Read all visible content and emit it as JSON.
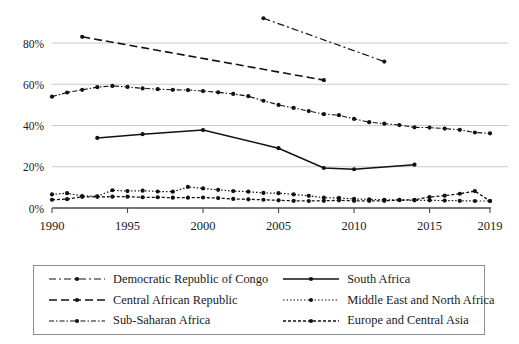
{
  "chart_data": {
    "type": "line",
    "title": "",
    "subtitle": "",
    "xlabel": "",
    "ylabel": "",
    "xlim": [
      1990,
      2019
    ],
    "ylim": [
      0,
      95
    ],
    "grid": true,
    "legend_position": "bottom",
    "x_tick_labels": [
      "1990",
      "1995",
      "2000",
      "2005",
      "2010",
      "2015",
      "2019"
    ],
    "x_ticks": [
      1990,
      1995,
      2000,
      2005,
      2010,
      2015,
      2019
    ],
    "y_tick_labels": [
      "0%",
      "20%",
      "40%",
      "60%",
      "80%"
    ],
    "y_ticks": [
      0,
      20,
      40,
      60,
      80
    ],
    "series": [
      {
        "name": "Democratic Republic of Congo",
        "style": "dash-dot",
        "dasharray": "7,3,2,3",
        "width": 1.2,
        "marker": "circle",
        "x": [
          2004,
          2012
        ],
        "values": [
          92,
          71
        ]
      },
      {
        "name": "Central African Republic",
        "style": "long-dash",
        "dasharray": "8,4",
        "width": 1.6,
        "marker": "circle",
        "x": [
          1992,
          2008
        ],
        "values": [
          83,
          62
        ]
      },
      {
        "name": "Sub-Saharan Africa",
        "style": "dash-dot-dense",
        "dasharray": "5,2,1.5,2",
        "width": 1.1,
        "marker": "circle",
        "x": [
          1990,
          1991,
          1992,
          1993,
          1994,
          1995,
          1996,
          1997,
          1998,
          1999,
          2000,
          2001,
          2002,
          2003,
          2004,
          2005,
          2006,
          2007,
          2008,
          2009,
          2010,
          2011,
          2012,
          2013,
          2014,
          2015,
          2016,
          2017,
          2018,
          2019
        ],
        "values": [
          54.0,
          56.0,
          57.3,
          58.6,
          59.2,
          58.7,
          58.0,
          57.6,
          57.3,
          57.2,
          56.7,
          56.1,
          55.3,
          54.2,
          52.0,
          50.0,
          48.5,
          47.0,
          45.5,
          45.0,
          43.2,
          41.6,
          40.9,
          40.2,
          39.1,
          39.0,
          38.5,
          37.9,
          36.6,
          36.2
        ]
      },
      {
        "name": "South Africa",
        "style": "solid",
        "dasharray": "",
        "width": 1.5,
        "marker": "circle",
        "x": [
          1993,
          1996,
          2000,
          2005,
          2008,
          2010,
          2014
        ],
        "values": [
          34.0,
          35.8,
          37.8,
          29.0,
          19.4,
          18.8,
          21.0
        ]
      },
      {
        "name": "Middle East and North Africa",
        "style": "dotted",
        "dasharray": "1.5,2",
        "width": 1.2,
        "marker": "circle",
        "x": [
          1990,
          1991,
          1992,
          1993,
          1994,
          1995,
          1996,
          1997,
          1998,
          1999,
          2000,
          2001,
          2002,
          2003,
          2004,
          2005,
          2006,
          2007,
          2008,
          2009,
          2010,
          2011,
          2012,
          2013,
          2014,
          2015,
          2016,
          2017,
          2018,
          2019
        ],
        "values": [
          6.6,
          7.2,
          5.8,
          5.7,
          8.6,
          8.2,
          8.4,
          8.0,
          7.9,
          10.2,
          9.5,
          8.8,
          8.2,
          7.9,
          7.3,
          7.2,
          6.6,
          5.9,
          5.0,
          4.9,
          4.4,
          4.2,
          4.0,
          3.9,
          3.7,
          3.7,
          3.6,
          3.5,
          3.4,
          3.4
        ]
      },
      {
        "name": "Europe and Central Asia",
        "style": "dashed",
        "dasharray": "3,2",
        "width": 1.3,
        "marker": "circle",
        "x": [
          1990,
          1991,
          1992,
          1993,
          1994,
          1995,
          1996,
          1997,
          1998,
          1999,
          2000,
          2001,
          2002,
          2003,
          2004,
          2005,
          2006,
          2007,
          2008,
          2009,
          2010,
          2011,
          2012,
          2013,
          2014,
          2015,
          2016,
          2017,
          2018,
          2019
        ],
        "values": [
          4.0,
          4.3,
          5.4,
          5.4,
          5.5,
          5.5,
          5.2,
          5.2,
          5.0,
          5.0,
          5.1,
          4.8,
          4.4,
          4.2,
          4.0,
          3.7,
          3.5,
          3.4,
          3.5,
          3.7,
          3.5,
          3.5,
          3.5,
          3.8,
          4.0,
          5.3,
          6.0,
          6.9,
          8.2,
          3.4
        ]
      }
    ]
  },
  "legend": {
    "entries": [
      {
        "label": "Democratic Republic of Congo",
        "sample": "dash-dot-line-sample"
      },
      {
        "label": "South Africa",
        "sample": "solid-line-sample"
      },
      {
        "label": "Central African Republic",
        "sample": "long-dash-line-sample"
      },
      {
        "label": "Middle East and North Africa",
        "sample": "dotted-line-sample"
      },
      {
        "label": "Sub-Saharan Africa",
        "sample": "dash-dot-dense-line-sample"
      },
      {
        "label": "Europe and Central Asia",
        "sample": "dashed-line-sample"
      }
    ]
  },
  "colors": {
    "series": "#111111",
    "gridline": "#c9c9c9",
    "axis": "#4a4a4a",
    "legend_border": "#8d8d8d",
    "background": "#ffffff"
  }
}
